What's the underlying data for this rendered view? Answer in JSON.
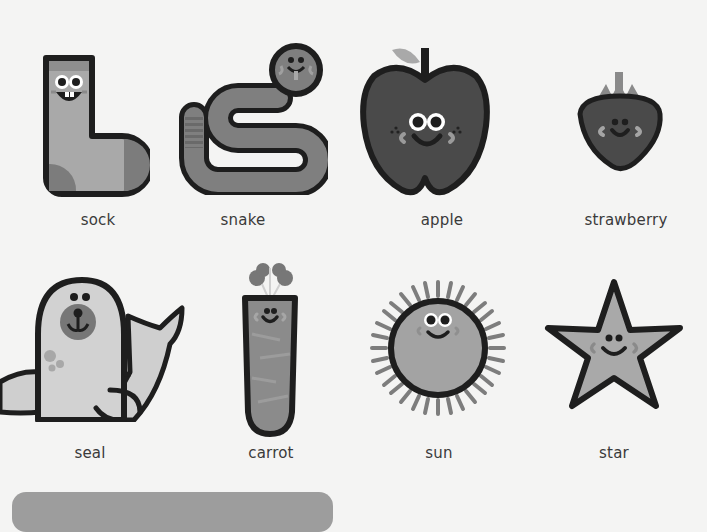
{
  "page": {
    "background": "#f4f4f3",
    "items": [
      {
        "label": "sock",
        "icon": "sock-icon"
      },
      {
        "label": "snake",
        "icon": "snake-icon"
      },
      {
        "label": "apple",
        "icon": "apple-icon"
      },
      {
        "label": "strawberry",
        "icon": "strawberry-icon"
      },
      {
        "label": "seal",
        "icon": "seal-icon"
      },
      {
        "label": "carrot",
        "icon": "carrot-icon"
      },
      {
        "label": "sun",
        "icon": "sun-icon"
      },
      {
        "label": "star",
        "icon": "star-icon"
      }
    ]
  },
  "colors": {
    "outline": "#1e1e1e",
    "label_text": "#3a3a3a",
    "banner": "#9d9d9d"
  }
}
